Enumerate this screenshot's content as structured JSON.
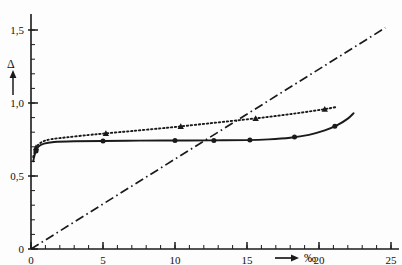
{
  "chart_data": {
    "type": "line",
    "title": "",
    "subtitle": "",
    "xlabel": "‰",
    "ylabel": "Δ",
    "xlim": [
      0,
      25
    ],
    "ylim": [
      0,
      1.65
    ],
    "grid": false,
    "legend_position": "none",
    "x_ticks": [
      0,
      5,
      10,
      15,
      20,
      25
    ],
    "x_tick_labels": [
      "0",
      "5",
      "10",
      "15",
      "20",
      "25"
    ],
    "x_minor_tick_step": 1,
    "y_ticks": [
      0,
      0.5,
      1.0,
      1.5
    ],
    "y_tick_labels": [
      "0",
      "0,5",
      "1,0",
      "1,5"
    ],
    "y_minor_tick_step": 0.1,
    "annotations": {
      "x_axis_arrow": "→",
      "y_axis_arrow": "↑",
      "y_axis_symbol": "Δ",
      "x_axis_symbol": "‰"
    },
    "series": [
      {
        "name": "upper-dotted",
        "style": "dotted",
        "marker": "triangle",
        "color": "#1a1a1a",
        "points": [
          [
            0.15,
            0.63
          ],
          [
            0.4,
            0.7
          ],
          [
            0.8,
            0.735
          ],
          [
            1.4,
            0.752
          ],
          [
            2.5,
            0.765
          ],
          [
            4.0,
            0.781
          ],
          [
            5.2,
            0.792
          ],
          [
            7.0,
            0.808
          ],
          [
            9.0,
            0.826
          ],
          [
            10.4,
            0.84
          ],
          [
            12.5,
            0.862
          ],
          [
            14.6,
            0.884
          ],
          [
            16.5,
            0.905
          ],
          [
            18.4,
            0.929
          ],
          [
            20.2,
            0.955
          ],
          [
            21.2,
            0.972
          ]
        ],
        "marker_points": [
          [
            0.35,
            0.695
          ],
          [
            5.2,
            0.792
          ],
          [
            10.4,
            0.84
          ],
          [
            15.6,
            0.894
          ],
          [
            20.4,
            0.958
          ]
        ]
      },
      {
        "name": "lower-solid",
        "style": "solid",
        "marker": "circle",
        "color": "#1a1a1a",
        "points": [
          [
            0.15,
            0.6
          ],
          [
            0.3,
            0.66
          ],
          [
            0.5,
            0.7
          ],
          [
            0.9,
            0.722
          ],
          [
            1.6,
            0.733
          ],
          [
            3.0,
            0.738
          ],
          [
            5.0,
            0.74
          ],
          [
            7.5,
            0.742
          ],
          [
            10.0,
            0.743
          ],
          [
            12.5,
            0.744
          ],
          [
            15.0,
            0.746
          ],
          [
            16.5,
            0.751
          ],
          [
            18.0,
            0.762
          ],
          [
            19.3,
            0.782
          ],
          [
            20.4,
            0.812
          ],
          [
            21.3,
            0.85
          ],
          [
            22.0,
            0.893
          ],
          [
            22.4,
            0.93
          ]
        ],
        "marker_points": [
          [
            0.35,
            0.672
          ],
          [
            5.0,
            0.74
          ],
          [
            10.0,
            0.743
          ],
          [
            12.7,
            0.744
          ],
          [
            15.2,
            0.747
          ],
          [
            18.3,
            0.767
          ],
          [
            21.1,
            0.841
          ]
        ]
      },
      {
        "name": "diagonal-dashdot",
        "style": "dashdot",
        "marker": "none",
        "color": "#1a1a1a",
        "points": [
          [
            0.0,
            0.0
          ],
          [
            24.6,
            1.515
          ]
        ]
      }
    ]
  }
}
